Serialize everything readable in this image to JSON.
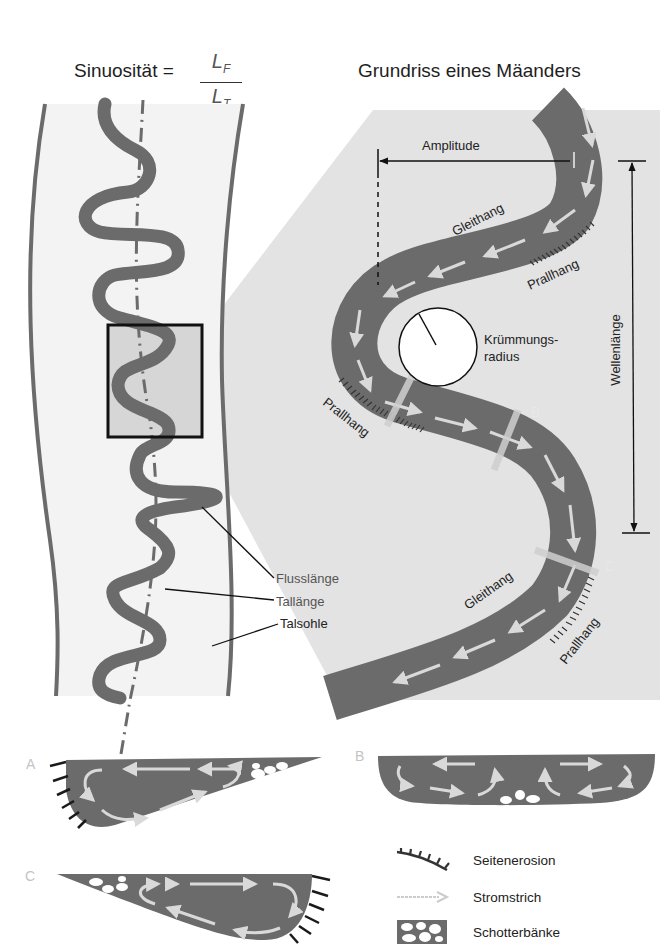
{
  "header": {
    "left_title": "Sinuosität =",
    "fraction_numerator": "L",
    "fraction_numerator_sub": "F",
    "fraction_denominator": "L",
    "fraction_denominator_sub": "T",
    "right_title": "Grundriss eines Mäanders"
  },
  "overview_panel": {
    "labels": {
      "river_length": "Flusslänge",
      "valley_length": "Tallänge",
      "valley_floor": "Talsohle"
    }
  },
  "meander_panel": {
    "labels": {
      "amplitude": "Amplitude",
      "wavelength": "Wellenlänge",
      "curvature_radius_line1": "Krümmungs-",
      "curvature_radius_line2": "radius",
      "slip_off_slope_top": "Gleithang",
      "cut_bank_top": "Prallhang",
      "cut_bank_left": "Prallhang",
      "slip_off_slope_bottom": "Gleithang",
      "cut_bank_bottom": "Prallhang",
      "section_a": "A",
      "section_b": "B",
      "section_c": "C"
    }
  },
  "cross_sections": {
    "a": {
      "letter": "A"
    },
    "b": {
      "letter": "B"
    },
    "c": {
      "letter": "C"
    }
  },
  "legend": {
    "items": [
      {
        "icon": "lateral-erosion-icon",
        "label": "Seitenerosion"
      },
      {
        "icon": "thalweg-arrow-icon",
        "label": "Stromstrich"
      },
      {
        "icon": "gravel-bar-icon",
        "label": "Schotterbänke"
      }
    ]
  },
  "colors": {
    "river": "#6b6b6b",
    "valley_floor": "#f2f2f2",
    "zoom_region": "#e3e3e3",
    "flow_arrow": "#d9d9d9",
    "text": "#222222",
    "section_letter": "#c4c4c4"
  }
}
